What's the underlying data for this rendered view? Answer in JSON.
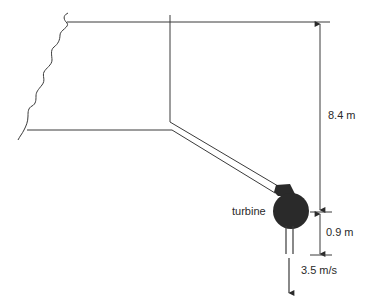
{
  "diagram": {
    "type": "hydro-turbine-schematic",
    "labels": {
      "turbine": "turbine",
      "head_upper": "8.4 m",
      "head_lower": "0.9 m",
      "exit_velocity": "3.5 m/s"
    },
    "colors": {
      "line": "#3a3a3a",
      "turbine_fill": "#2a2a2a",
      "background": "#ffffff"
    }
  }
}
